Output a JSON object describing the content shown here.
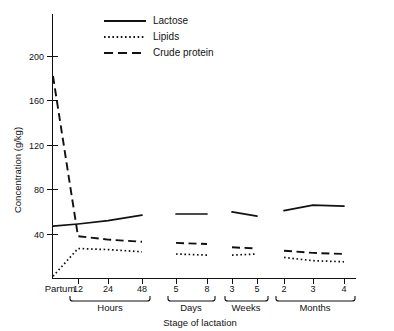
{
  "chart_data": {
    "type": "line",
    "title": "",
    "xlabel": "Stage of lactation",
    "ylabel": "Concentration (g/kg)",
    "ylim": [
      0,
      215
    ],
    "yticks": [
      40,
      80,
      120,
      160,
      200
    ],
    "grid": false,
    "legend_position": "top-center",
    "x_categories": [
      "Partum",
      "12",
      "24",
      "48",
      "5",
      "8",
      "3",
      "5",
      "2",
      "3",
      "4"
    ],
    "x_groups": [
      {
        "label": "Partum",
        "ticks": []
      },
      {
        "label": "Hours",
        "ticks": [
          "12",
          "24",
          "48"
        ]
      },
      {
        "label": "Days",
        "ticks": [
          "5",
          "8"
        ]
      },
      {
        "label": "Weeks",
        "ticks": [
          "3",
          "5"
        ]
      },
      {
        "label": "Months",
        "ticks": [
          "2",
          "3",
          "4"
        ]
      }
    ],
    "series": [
      {
        "name": "Lactose",
        "style": "solid",
        "points": [
          {
            "x": "Partum",
            "y": 47
          },
          {
            "x": "12",
            "y": 49
          },
          {
            "x": "24",
            "y": 52
          },
          {
            "x": "48",
            "y": 57
          },
          {
            "x": "5",
            "y": 58
          },
          {
            "x": "8",
            "y": 58
          },
          {
            "x": "3",
            "y": 60
          },
          {
            "x": "5",
            "y": 56
          },
          {
            "x": "2",
            "y": 61
          },
          {
            "x": "3",
            "y": 66
          },
          {
            "x": "4",
            "y": 65
          }
        ]
      },
      {
        "name": "Lipids",
        "style": "dotted",
        "points": [
          {
            "x": "Partum",
            "y": 2
          },
          {
            "x": "12",
            "y": 27
          },
          {
            "x": "24",
            "y": 26
          },
          {
            "x": "48",
            "y": 24
          },
          {
            "x": "5",
            "y": 22
          },
          {
            "x": "8",
            "y": 21
          },
          {
            "x": "3",
            "y": 21
          },
          {
            "x": "5",
            "y": 22
          },
          {
            "x": "2",
            "y": 19
          },
          {
            "x": "3",
            "y": 16
          },
          {
            "x": "4",
            "y": 15
          }
        ]
      },
      {
        "name": "Crude protein",
        "style": "dashed",
        "points": [
          {
            "x": "Partum",
            "y": 182
          },
          {
            "x": "12",
            "y": 38
          },
          {
            "x": "24",
            "y": 35
          },
          {
            "x": "48",
            "y": 33
          },
          {
            "x": "5",
            "y": 32
          },
          {
            "x": "8",
            "y": 31
          },
          {
            "x": "3",
            "y": 28
          },
          {
            "x": "5",
            "y": 27
          },
          {
            "x": "2",
            "y": 25
          },
          {
            "x": "3",
            "y": 23
          },
          {
            "x": "4",
            "y": 22
          }
        ]
      }
    ]
  },
  "legend": {
    "items": [
      {
        "label": "Lactose",
        "style": "solid"
      },
      {
        "label": "Lipids",
        "style": "dotted"
      },
      {
        "label": "Crude protein",
        "style": "dashed"
      }
    ]
  },
  "axes": {
    "y_title": "Concentration (g/kg)",
    "x_title": "Stage of lactation",
    "y_tick_labels": [
      "200",
      "160",
      "120",
      "80",
      "40"
    ],
    "x_tick_labels": [
      "12",
      "24",
      "48",
      "5",
      "8",
      "3",
      "5",
      "2",
      "3",
      "4"
    ],
    "partum_label": "Partum",
    "group_labels": [
      "Hours",
      "Days",
      "Weeks",
      "Months"
    ]
  },
  "colors": {
    "ink": "#111111",
    "background": "#ffffff"
  }
}
